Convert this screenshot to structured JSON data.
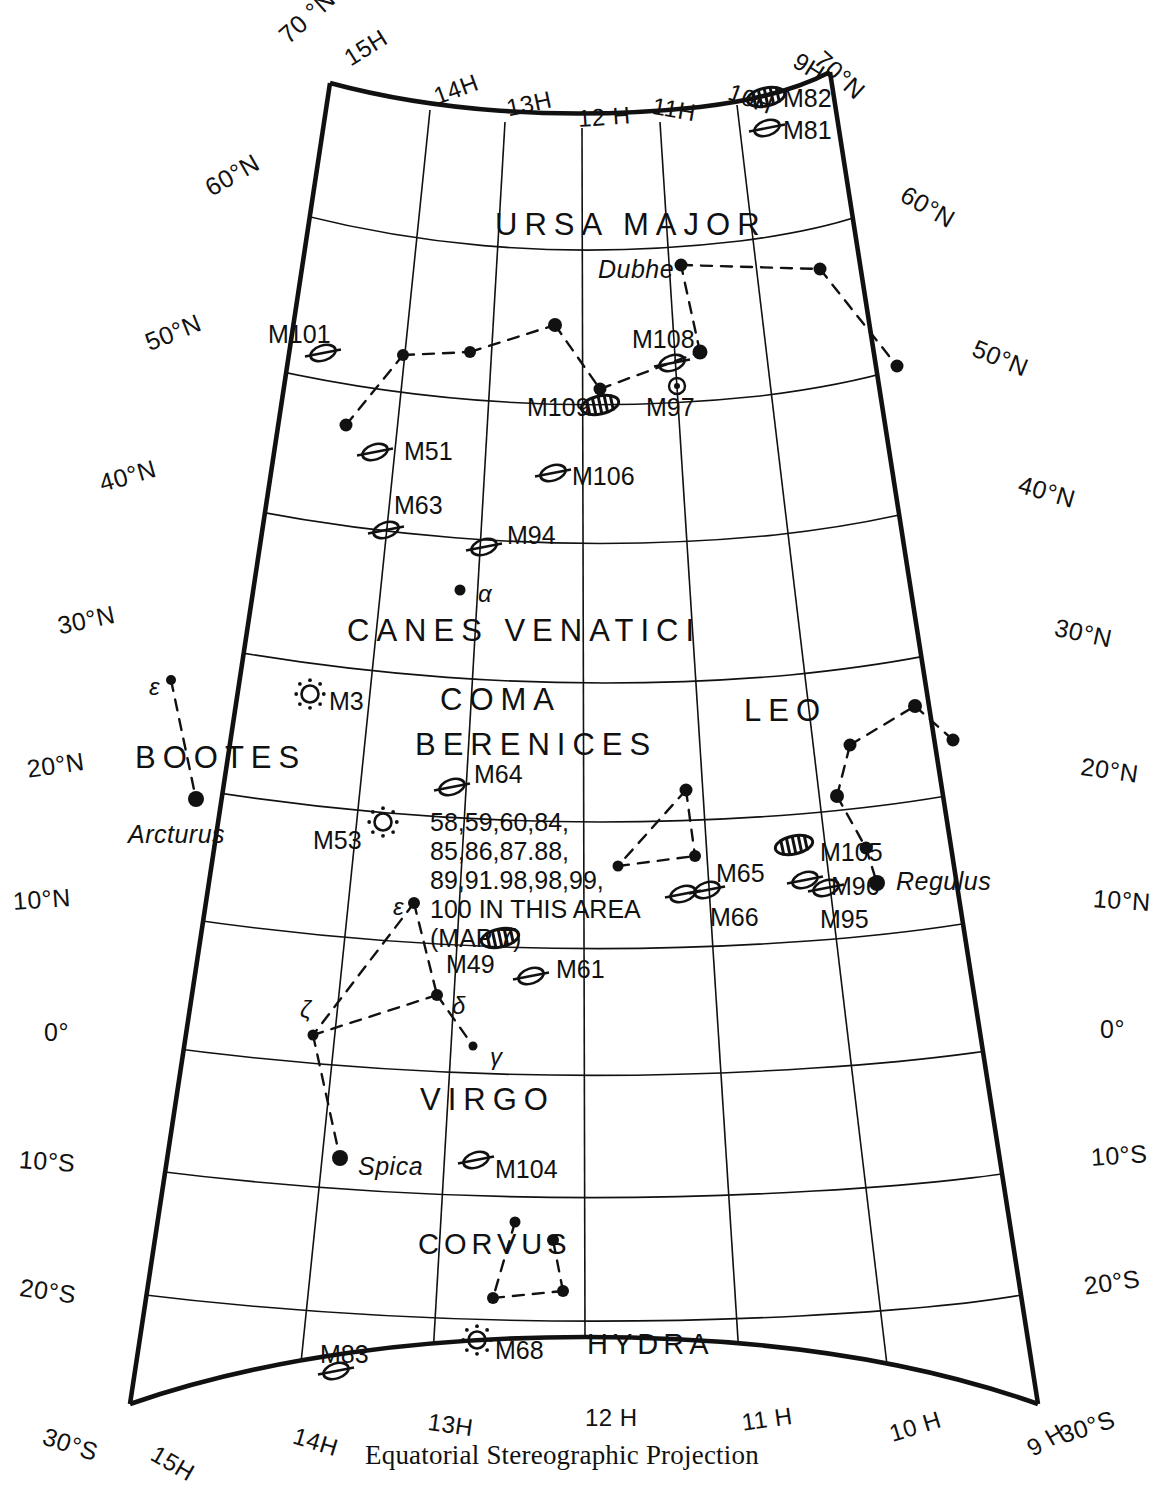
{
  "chart_data": {
    "type": "map",
    "title": "Equatorial Stereographic Projection",
    "projection": "Equatorial Stereographic Projection",
    "ra_range_hours": [
      9,
      15
    ],
    "dec_range_deg": [
      -30,
      70
    ],
    "ra_tick_labels_top": [
      "15H",
      "14H",
      "13H",
      "12 H",
      "11H",
      "10H",
      "9H"
    ],
    "ra_tick_labels_bottom": [
      "15H",
      "14H",
      "13H",
      "12 H",
      "11 H",
      "10 H",
      "9 H"
    ],
    "dec_tick_labels_left": [
      "70 °N",
      "60°N",
      "50°N",
      "40°N",
      "30°N",
      "20°N",
      "10°N",
      "0°",
      "10°S",
      "20°S",
      "30°S"
    ],
    "dec_tick_labels_right": [
      "70°N",
      "60°N",
      "50°N",
      "40°N",
      "30°N",
      "20°N",
      "10°N",
      "0°",
      "10°S",
      "20°S",
      "30°S"
    ],
    "grid": true
  },
  "caption": "Equatorial Stereographic Projection",
  "ra_top": [
    {
      "label": "15H",
      "x": 339,
      "y": 48
    },
    {
      "label": "14H",
      "x": 430,
      "y": 84
    },
    {
      "label": "13H",
      "x": 504,
      "y": 95
    },
    {
      "label": "12 H",
      "x": 577,
      "y": 105
    },
    {
      "label": "11H",
      "x": 655,
      "y": 92
    },
    {
      "label": "10H",
      "x": 734,
      "y": 78
    },
    {
      "label": "9H",
      "x": 803,
      "y": 47
    }
  ],
  "ra_bottom": [
    {
      "label": "15H",
      "x": 160,
      "y": 1440
    },
    {
      "label": "14H",
      "x": 298,
      "y": 1422
    },
    {
      "label": "13H",
      "x": 430,
      "y": 1408
    },
    {
      "label": "12 H",
      "x": 585,
      "y": 1404
    },
    {
      "label": "11 H",
      "x": 740,
      "y": 1409
    },
    {
      "label": "10 H",
      "x": 886,
      "y": 1421
    },
    {
      "label": "9 H",
      "x": 1022,
      "y": 1438
    }
  ],
  "dec_left": [
    {
      "label": "70 °N",
      "x": 273,
      "y": 28
    },
    {
      "label": "60°N",
      "x": 200,
      "y": 177
    },
    {
      "label": "50°N",
      "x": 141,
      "y": 330
    },
    {
      "label": "40°N",
      "x": 96,
      "y": 470
    },
    {
      "label": "30°N",
      "x": 55,
      "y": 612
    },
    {
      "label": "20°N",
      "x": 25,
      "y": 755
    },
    {
      "label": "10°N",
      "x": 12,
      "y": 887
    },
    {
      "label": "0°",
      "x": 44,
      "y": 1018
    },
    {
      "label": "10°S",
      "x": 20,
      "y": 1145
    },
    {
      "label": "20°S",
      "x": 22,
      "y": 1273
    },
    {
      "label": "30°S",
      "x": 48,
      "y": 1422
    }
  ],
  "dec_right": [
    {
      "label": "70°N",
      "x": 828,
      "y": 45
    },
    {
      "label": "60°N",
      "x": 910,
      "y": 180
    },
    {
      "label": "50°N",
      "x": 979,
      "y": 334
    },
    {
      "label": "40°N",
      "x": 1023,
      "y": 470
    },
    {
      "label": "30°N",
      "x": 1058,
      "y": 613
    },
    {
      "label": "20°N",
      "x": 1083,
      "y": 752
    },
    {
      "label": "10°N",
      "x": 1094,
      "y": 884
    },
    {
      "label": "0°",
      "x": 1100,
      "y": 1015
    },
    {
      "label": "10°S",
      "x": 1090,
      "y": 1143
    },
    {
      "label": "20°S",
      "x": 1082,
      "y": 1272
    },
    {
      "label": "30°S",
      "x": 1056,
      "y": 1422
    }
  ],
  "constellations": [
    {
      "name": "URSA MAJOR",
      "x": 495,
      "y": 207,
      "cls": "const"
    },
    {
      "name": "CANES VENATICI",
      "x": 347,
      "y": 613,
      "cls": "const"
    },
    {
      "name": "COMA",
      "x": 440,
      "y": 682,
      "cls": "const"
    },
    {
      "name": "BERENICES",
      "x": 415,
      "y": 727,
      "cls": "const"
    },
    {
      "name": "BOOTES",
      "x": 135,
      "y": 740,
      "cls": "const"
    },
    {
      "name": "LEO",
      "x": 744,
      "y": 693,
      "cls": "const"
    },
    {
      "name": "VIRGO",
      "x": 420,
      "y": 1082,
      "cls": "const"
    },
    {
      "name": "CORVUS",
      "x": 418,
      "y": 1228,
      "cls": "const-sm"
    },
    {
      "name": "HYDRA",
      "x": 587,
      "y": 1328,
      "cls": "const-sm"
    }
  ],
  "messier": [
    {
      "label": "M82",
      "x": 783,
      "y": 84,
      "sym": "galaxy-bar",
      "sx": 766,
      "sy": 97
    },
    {
      "label": "M81",
      "x": 783,
      "y": 116,
      "sym": "galaxy-oval",
      "sx": 767,
      "sy": 128
    },
    {
      "label": "M101",
      "x": 268,
      "y": 320,
      "sym": "galaxy-oval",
      "sx": 323,
      "sy": 353
    },
    {
      "label": "M108",
      "x": 632,
      "y": 325,
      "sym": "galaxy-oval",
      "sx": 672,
      "sy": 363
    },
    {
      "label": "M97",
      "x": 646,
      "y": 393,
      "sym": "planetary",
      "sx": 677,
      "sy": 386
    },
    {
      "label": "M109",
      "x": 527,
      "y": 393,
      "sym": "galaxy-bar",
      "sx": 600,
      "sy": 405
    },
    {
      "label": "M51",
      "x": 404,
      "y": 437,
      "sym": "galaxy-oval",
      "sx": 375,
      "sy": 452
    },
    {
      "label": "M106",
      "x": 572,
      "y": 462,
      "sym": "galaxy-oval",
      "sx": 553,
      "sy": 473
    },
    {
      "label": "M63",
      "x": 394,
      "y": 491,
      "sym": "galaxy-oval",
      "sx": 386,
      "sy": 530
    },
    {
      "label": "M94",
      "x": 507,
      "y": 521,
      "sym": "galaxy-oval",
      "sx": 484,
      "sy": 547
    },
    {
      "label": "M3",
      "x": 329,
      "y": 687,
      "sym": "globular",
      "sx": 310,
      "sy": 694
    },
    {
      "label": "M64",
      "x": 474,
      "y": 760,
      "sym": "galaxy-oval",
      "sx": 452,
      "sy": 787
    },
    {
      "label": "M53",
      "x": 313,
      "y": 826,
      "sym": "globular",
      "sx": 383,
      "sy": 822
    },
    {
      "label": "M105",
      "x": 820,
      "y": 838,
      "sym": "galaxy-bar",
      "sx": 794,
      "sy": 845
    },
    {
      "label": "M65",
      "x": 716,
      "y": 859,
      "sym": "galaxy-oval",
      "sx": 707,
      "sy": 890
    },
    {
      "label": "M96",
      "x": 831,
      "y": 872,
      "sym": "galaxy-oval",
      "sx": 805,
      "sy": 880
    },
    {
      "label": "M66",
      "x": 710,
      "y": 903,
      "sym": "galaxy-oval",
      "sx": 683,
      "sy": 894
    },
    {
      "label": "M95",
      "x": 820,
      "y": 905,
      "sym": "galaxy-oval",
      "sx": 826,
      "sy": 888
    },
    {
      "label": "M49",
      "x": 446,
      "y": 950,
      "sym": "galaxy-bar",
      "sx": 500,
      "sy": 938
    },
    {
      "label": "M61",
      "x": 556,
      "y": 955,
      "sym": "galaxy-oval",
      "sx": 531,
      "sy": 976
    },
    {
      "label": "M104",
      "x": 495,
      "y": 1155,
      "sym": "galaxy-oval",
      "sx": 476,
      "sy": 1160
    },
    {
      "label": "M68",
      "x": 495,
      "y": 1336,
      "sym": "globular",
      "sx": 477,
      "sy": 1340
    },
    {
      "label": "M83",
      "x": 320,
      "y": 1340,
      "sym": "galaxy-oval",
      "sx": 336,
      "sy": 1371
    }
  ],
  "named_stars": [
    {
      "name": "Dubhe",
      "x": 598,
      "y": 255,
      "sx": 681,
      "sy": 265,
      "r": 6.5
    },
    {
      "name": "Arcturus",
      "x": 128,
      "y": 820,
      "sx": 196,
      "sy": 799,
      "r": 8
    },
    {
      "name": "Regulus",
      "x": 896,
      "y": 867,
      "sx": 877,
      "sy": 883,
      "r": 8
    },
    {
      "name": "Spica",
      "x": 358,
      "y": 1152,
      "sx": 340,
      "sy": 1158,
      "r": 8
    }
  ],
  "greek_labels": [
    {
      "name": "α",
      "x": 478,
      "y": 580,
      "sx": 460,
      "sy": 590,
      "r": 5.5
    },
    {
      "name": "ε",
      "x": 149,
      "y": 673,
      "sx": 171,
      "sy": 680,
      "r": 5
    },
    {
      "name": "ε",
      "x": 393,
      "y": 893,
      "sx": 414,
      "sy": 903,
      "r": 6
    },
    {
      "name": "ζ",
      "x": 300,
      "y": 996,
      "sx": 313,
      "sy": 1035,
      "r": 5.5
    },
    {
      "name": "δ",
      "x": 452,
      "y": 992,
      "sx": 437,
      "sy": 995,
      "r": 6
    },
    {
      "name": "γ",
      "x": 490,
      "y": 1043,
      "sx": 473,
      "sy": 1046,
      "r": 4.5
    }
  ],
  "virgo_block": {
    "lines": [
      "58,59,60,84,",
      "85,86,87.88,",
      "89,91.98,98,99,",
      "100 IN THIS AREA",
      "(MAP 7)"
    ],
    "x": 430,
    "y": 808
  },
  "plain_stars": [
    {
      "x": 403,
      "y": 355,
      "r": 6
    },
    {
      "x": 470,
      "y": 352,
      "r": 6
    },
    {
      "x": 555,
      "y": 325,
      "r": 7
    },
    {
      "x": 600,
      "y": 389,
      "r": 6.5
    },
    {
      "x": 700,
      "y": 352,
      "r": 7.5
    },
    {
      "x": 346,
      "y": 425,
      "r": 6.5
    },
    {
      "x": 820,
      "y": 269,
      "r": 6.5
    },
    {
      "x": 897,
      "y": 366,
      "r": 6.5
    },
    {
      "x": 686,
      "y": 790,
      "r": 6.5
    },
    {
      "x": 695,
      "y": 856,
      "r": 6
    },
    {
      "x": 618,
      "y": 866,
      "r": 5.5
    },
    {
      "x": 837,
      "y": 796,
      "r": 7
    },
    {
      "x": 850,
      "y": 745,
      "r": 6.5
    },
    {
      "x": 915,
      "y": 706,
      "r": 7
    },
    {
      "x": 953,
      "y": 740,
      "r": 6.5
    },
    {
      "x": 866,
      "y": 848,
      "r": 6.5
    },
    {
      "x": 515,
      "y": 1222,
      "r": 5.5
    },
    {
      "x": 553,
      "y": 1240,
      "r": 6
    },
    {
      "x": 493,
      "y": 1298,
      "r": 6
    },
    {
      "x": 563,
      "y": 1291,
      "r": 6
    }
  ]
}
